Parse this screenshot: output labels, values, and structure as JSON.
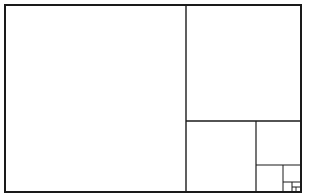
{
  "diagram": {
    "type": "golden-rectangle-subdivision",
    "stroke_color": "#1a1a1a",
    "background": "#ffffff",
    "outer_rect": {
      "x": 5,
      "y": 5,
      "w": 296,
      "h": 187,
      "stroke_width": 2
    },
    "lines": [
      {
        "id": "v1",
        "x1": 186,
        "y1": 5,
        "x2": 186,
        "y2": 192,
        "w": 1.4
      },
      {
        "id": "h1",
        "x1": 186,
        "y1": 121,
        "x2": 301,
        "y2": 121,
        "w": 1.4
      },
      {
        "id": "v2",
        "x1": 256,
        "y1": 121,
        "x2": 256,
        "y2": 192,
        "w": 1.2
      },
      {
        "id": "h2",
        "x1": 256,
        "y1": 165,
        "x2": 301,
        "y2": 165,
        "w": 1.1
      },
      {
        "id": "v3",
        "x1": 283,
        "y1": 165,
        "x2": 283,
        "y2": 192,
        "w": 1.0
      },
      {
        "id": "h3",
        "x1": 283,
        "y1": 182,
        "x2": 301,
        "y2": 182,
        "w": 1.0
      },
      {
        "id": "v4",
        "x1": 292,
        "y1": 182,
        "x2": 292,
        "y2": 192,
        "w": 1.0
      },
      {
        "id": "h4",
        "x1": 292,
        "y1": 187,
        "x2": 301,
        "y2": 187,
        "w": 1.0
      },
      {
        "id": "v5",
        "x1": 296,
        "y1": 187,
        "x2": 296,
        "y2": 192,
        "w": 0.9
      }
    ]
  }
}
